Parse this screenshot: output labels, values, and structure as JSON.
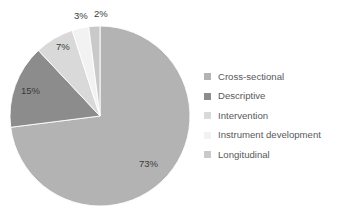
{
  "chart_data": {
    "type": "pie",
    "title": "",
    "subtitle": "",
    "xlabel": "",
    "ylabel": "",
    "grid": false,
    "legend_position": "right",
    "units": "percent",
    "total": 100,
    "start_angle_deg": 0,
    "direction": "clockwise",
    "categories": [
      "Cross-sectional",
      "Descriptive",
      "Intervention",
      "Instrument development",
      "Longitudinal"
    ],
    "values": [
      73,
      15,
      7,
      3,
      2
    ],
    "data_labels": [
      "73%",
      "15%",
      "7%",
      "3%",
      "2%"
    ],
    "colors": [
      "#b3b3b3",
      "#8c8c8c",
      "#d9d9d9",
      "#f2f2f2",
      "#c9c9c9"
    ],
    "slices": [
      {
        "label": "Cross-sectional",
        "value": 73,
        "data_label": "73%",
        "color": "#b3b3b3"
      },
      {
        "label": "Descriptive",
        "value": 15,
        "data_label": "15%",
        "color": "#8c8c8c"
      },
      {
        "label": "Intervention",
        "value": 7,
        "data_label": "7%",
        "color": "#d9d9d9"
      },
      {
        "label": "Instrument development",
        "value": 3,
        "data_label": "3%",
        "color": "#f2f2f2"
      },
      {
        "label": "Longitudinal",
        "value": 2,
        "data_label": "2%",
        "color": "#c9c9c9"
      }
    ]
  },
  "labels": {
    "pct_cross_sectional": "73%",
    "pct_descriptive": "15%",
    "pct_intervention": "7%",
    "pct_instrument_development": "3%",
    "pct_longitudinal": "2%"
  },
  "legend": {
    "items": [
      {
        "label": "Cross-sectional",
        "color": "#b3b3b3"
      },
      {
        "label": "Descriptive",
        "color": "#8c8c8c"
      },
      {
        "label": "Intervention",
        "color": "#d9d9d9"
      },
      {
        "label": "Instrument development",
        "color": "#f2f2f2"
      },
      {
        "label": "Longitudinal",
        "color": "#c9c9c9"
      }
    ]
  },
  "colors": {
    "background": "#ffffff",
    "label_text": "#3a3a3a",
    "legend_text": "#58595b"
  }
}
